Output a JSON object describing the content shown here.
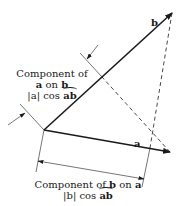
{
  "diagram": {
    "vectors": {
      "a": {
        "label": "a"
      },
      "b": {
        "label": "b"
      }
    },
    "component_a_on_b": {
      "line1": "Component of",
      "line2_a": "a",
      "line2_on": "on",
      "line2_b": "b",
      "line3_abs": "|a|",
      "line3_cos": "cos",
      "line3_angle": "ab"
    },
    "component_b_on_a": {
      "line1_prefix": "Component of",
      "line1_b": "b",
      "line1_on": "on",
      "line1_a": "a",
      "line2_abs": "|b|",
      "line2_cos": "cos",
      "line2_angle": "ab"
    },
    "colors": {
      "stroke": "#1a1a1a",
      "background": "#ffffff"
    }
  }
}
